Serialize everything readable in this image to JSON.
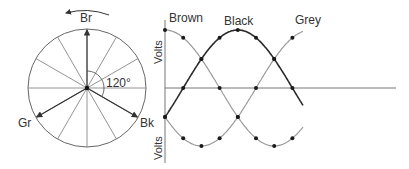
{
  "phasor": {
    "labels": {
      "top": "Br",
      "left": "Gr",
      "right": "Bk"
    },
    "angle_label": "120°",
    "rotation": "counter-clockwise",
    "spokes_every_deg": 30
  },
  "waveform": {
    "y_label_top": "Volts",
    "y_label_bottom": "Volts",
    "series_labels": {
      "brown": "Brown",
      "black": "Black",
      "grey": "Grey"
    }
  },
  "colors": {
    "black_wave": "#2a2a2a",
    "grey_wave": "#9a9a9a",
    "axis": "#777777",
    "dot": "#1a1a1a"
  }
}
